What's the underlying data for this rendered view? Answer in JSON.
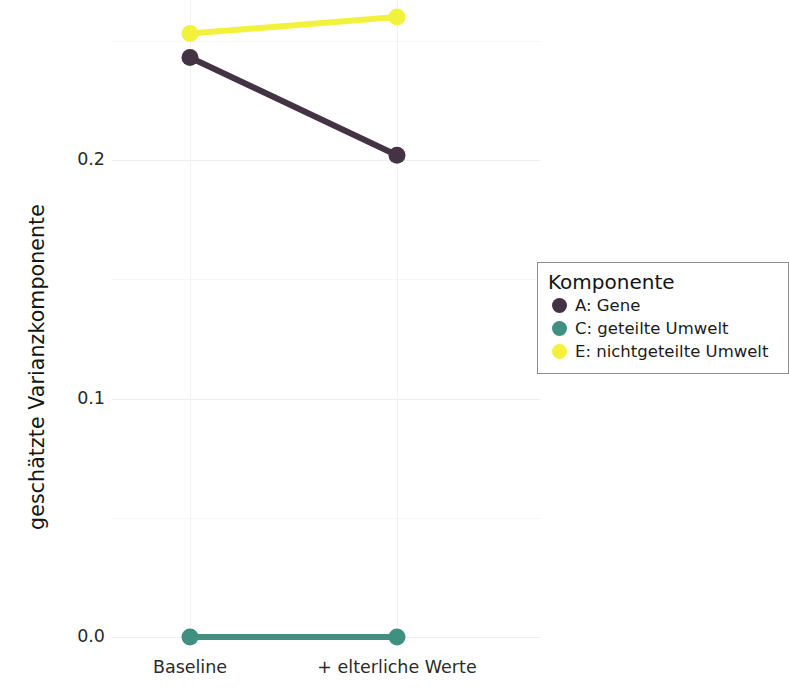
{
  "chart_data": {
    "type": "line",
    "title": "",
    "subtitle": "",
    "xlabel": "",
    "ylabel": "geschätzte Varianzkomponente",
    "categories": [
      "Baseline",
      "+ elterliche Werte"
    ],
    "series": [
      {
        "name": "A: Gene",
        "key": "A",
        "color": "#443344",
        "values": [
          0.243,
          0.202
        ]
      },
      {
        "name": "C: geteilte Umwelt",
        "key": "C",
        "color": "#3f9080",
        "values": [
          0.0,
          0.0
        ]
      },
      {
        "name": "E: nichtgeteilte Umwelt",
        "key": "E",
        "color": "#f2f23c",
        "values": [
          0.253,
          0.26
        ]
      }
    ],
    "ylim": [
      0.0,
      0.272
    ],
    "yticks": [
      "0.0",
      "0.1",
      "0.2"
    ],
    "ytick_values": [
      0.0,
      0.1,
      0.2
    ],
    "minor_yticks": [
      0.05,
      0.15,
      0.25
    ],
    "grid": true,
    "legend_position": "right",
    "legend_title": "Komponente",
    "marker": "circle",
    "linewidth": 6
  },
  "axis": {
    "y_title": "geschätzte Varianzkomponente",
    "y_ticks": [
      {
        "label": "0.2",
        "value": 0.2
      },
      {
        "label": "0.1",
        "value": 0.1
      },
      {
        "label": "0.0",
        "value": 0.0
      }
    ],
    "x_ticks": [
      {
        "label": "Baseline"
      },
      {
        "label": "+ elterliche Werte"
      }
    ]
  },
  "legend": {
    "title": "Komponente",
    "items": [
      {
        "label": "A: Gene",
        "color": "#443344"
      },
      {
        "label": "C: geteilte Umwelt",
        "color": "#3f9080"
      },
      {
        "label": "E: nichtgeteilte Umwelt",
        "color": "#f2f23c"
      }
    ]
  }
}
